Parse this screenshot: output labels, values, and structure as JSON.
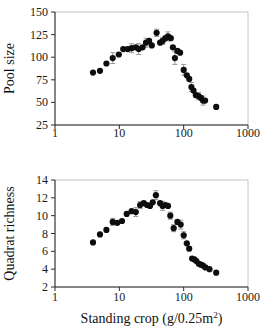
{
  "figure": {
    "background": "#ffffff",
    "point_color": "#0d0d0d",
    "axis_color": "#2a2a2a",
    "errorbar_color": "#999999",
    "frame_color": "#c4c4c4"
  },
  "chart_data": [
    {
      "type": "scatter",
      "title": "",
      "ylabel": "Pool size",
      "xlabel": "",
      "xscale": "log",
      "xlim": [
        1,
        1000
      ],
      "ylim": [
        25,
        150
      ],
      "xticks": [
        1,
        10,
        100,
        1000
      ],
      "yticks": [
        25,
        50,
        75,
        100,
        125,
        150
      ],
      "grid": false,
      "legend": "none",
      "series": [
        {
          "name": "pool-size",
          "marker": "filled-circle",
          "points": [
            [
              3.9,
              83,
              0
            ],
            [
              5,
              85,
              0
            ],
            [
              6.3,
              93,
              0
            ],
            [
              7.9,
              99,
              6
            ],
            [
              9.8,
              103,
              0
            ],
            [
              11.5,
              109,
              0
            ],
            [
              13.5,
              109,
              0
            ],
            [
              15.5,
              110,
              5
            ],
            [
              18,
              111,
              0
            ],
            [
              20,
              109,
              6
            ],
            [
              23,
              111,
              0
            ],
            [
              26,
              116,
              5
            ],
            [
              29,
              118,
              0
            ],
            [
              32,
              113,
              0
            ],
            [
              38,
              127,
              4
            ],
            [
              43,
              116,
              0
            ],
            [
              47,
              118,
              4
            ],
            [
              52,
              121,
              0
            ],
            [
              57,
              123,
              5
            ],
            [
              63,
              121,
              0
            ],
            [
              68,
              111,
              0
            ],
            [
              73,
              99,
              7
            ],
            [
              80,
              107,
              0
            ],
            [
              88,
              105,
              0
            ],
            [
              100,
              86,
              6
            ],
            [
              112,
              80,
              0
            ],
            [
              122,
              76,
              0
            ],
            [
              132,
              67,
              5
            ],
            [
              142,
              63,
              0
            ],
            [
              155,
              58,
              0
            ],
            [
              170,
              57,
              4
            ],
            [
              185,
              55,
              0
            ],
            [
              200,
              52,
              5
            ],
            [
              215,
              52,
              0
            ],
            [
              320,
              45,
              0
            ]
          ]
        }
      ]
    },
    {
      "type": "scatter",
      "title": "",
      "ylabel": "Quadrat richness",
      "xlabel": "Standing crop (g/0.25m²)",
      "xscale": "log",
      "xlim": [
        1,
        1000
      ],
      "ylim": [
        2,
        14
      ],
      "xticks": [
        1,
        10,
        100,
        1000
      ],
      "yticks": [
        2,
        4,
        6,
        8,
        10,
        12,
        14
      ],
      "grid": false,
      "legend": "none",
      "series": [
        {
          "name": "quadrat-richness",
          "marker": "filled-circle",
          "points": [
            [
              3.9,
              7,
              0
            ],
            [
              5,
              7.9,
              0
            ],
            [
              6.3,
              8.4,
              0
            ],
            [
              7.9,
              9.3,
              0.4
            ],
            [
              9.3,
              9.2,
              0
            ],
            [
              11,
              9.4,
              0
            ],
            [
              13,
              10.2,
              0
            ],
            [
              15.5,
              10.5,
              0
            ],
            [
              18,
              10.4,
              0.5
            ],
            [
              21,
              11.2,
              0.4
            ],
            [
              24,
              11.4,
              0
            ],
            [
              27,
              11.2,
              0
            ],
            [
              30,
              11.1,
              0
            ],
            [
              33,
              11.5,
              0
            ],
            [
              37,
              12.3,
              0.5
            ],
            [
              43,
              11.4,
              0
            ],
            [
              47,
              11.1,
              0.5
            ],
            [
              52,
              11.2,
              0
            ],
            [
              57,
              11.1,
              0
            ],
            [
              62,
              10,
              0.4
            ],
            [
              70,
              8.6,
              0.4
            ],
            [
              80,
              9.3,
              0
            ],
            [
              90,
              9,
              0.5
            ],
            [
              100,
              7.8,
              0.4
            ],
            [
              112,
              6.9,
              0
            ],
            [
              122,
              6.3,
              0
            ],
            [
              135,
              5.2,
              0
            ],
            [
              147,
              5.1,
              0
            ],
            [
              158,
              4.9,
              0
            ],
            [
              172,
              4.6,
              0
            ],
            [
              186,
              4.5,
              0
            ],
            [
              200,
              4.4,
              0
            ],
            [
              218,
              4.2,
              0
            ],
            [
              252,
              4,
              0
            ],
            [
              320,
              3.6,
              0
            ]
          ]
        }
      ]
    }
  ]
}
